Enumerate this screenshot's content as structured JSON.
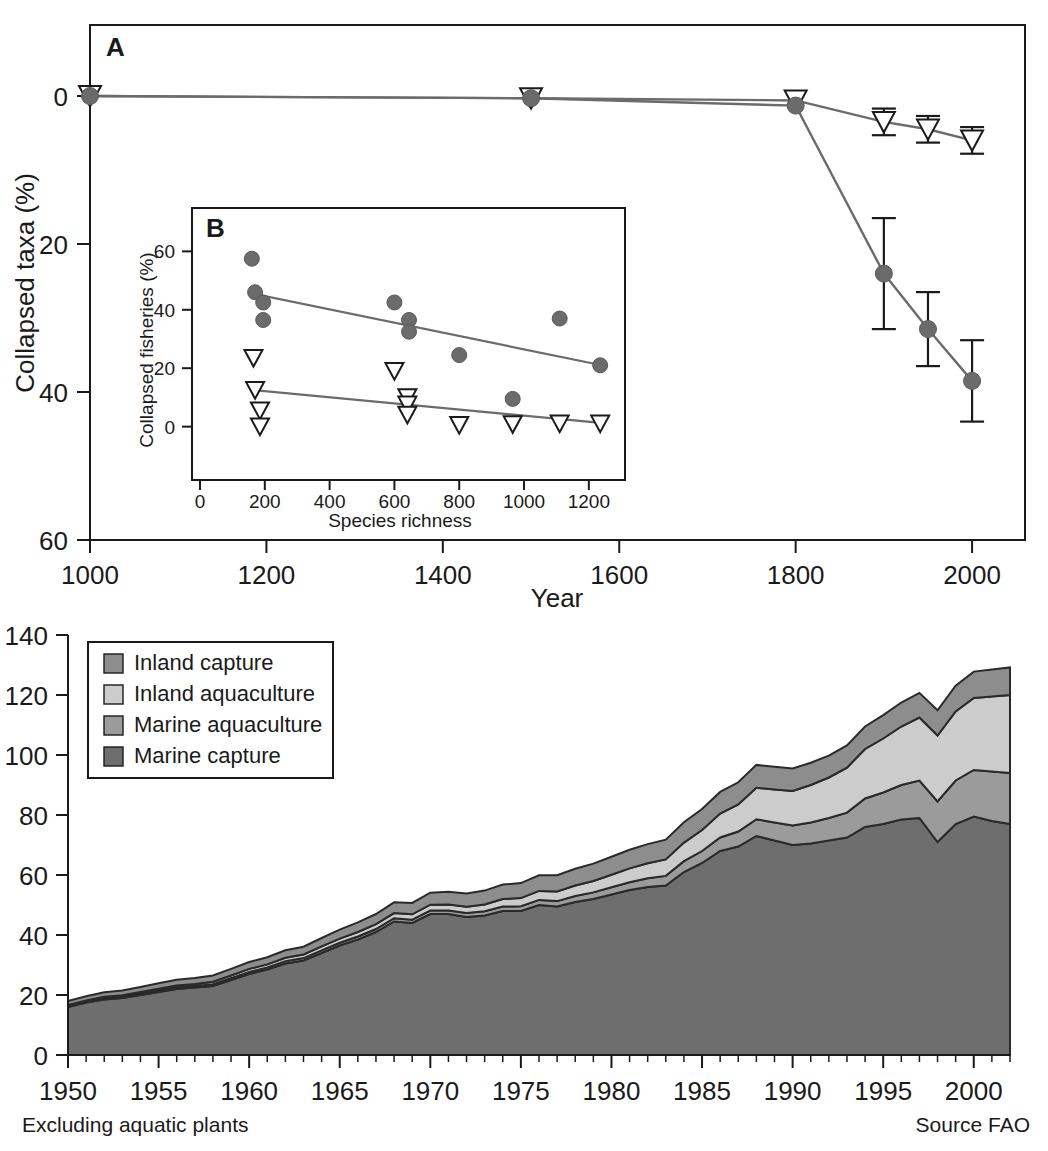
{
  "figure": {
    "panels": [
      "A",
      "B",
      "C"
    ]
  },
  "panel_a": {
    "letter": "A",
    "xlabel": "Year",
    "ylabel": "Collapsed taxa (%)",
    "xticks": [
      1000,
      1200,
      1400,
      1600,
      1800,
      2000
    ],
    "yticks": [
      0,
      20,
      40,
      60
    ],
    "xlim": [
      1000,
      2060
    ],
    "ylim": [
      0,
      60
    ],
    "y_inverted": true
  },
  "panel_b": {
    "letter": "B",
    "xlabel": "Species richness",
    "ylabel": "Collapsed fisheries (%)",
    "xticks": [
      0,
      200,
      400,
      600,
      800,
      1000,
      1200
    ],
    "yticks": [
      0,
      20,
      40,
      60
    ],
    "xlim": [
      0,
      1290
    ],
    "ylim": [
      -8,
      68
    ]
  },
  "panel_c": {
    "xticks": [
      1950,
      1955,
      1960,
      1965,
      1970,
      1975,
      1980,
      1985,
      1990,
      1995,
      2000
    ],
    "yticks": [
      0,
      20,
      40,
      60,
      80,
      100,
      120,
      140
    ],
    "xlim": [
      1950,
      2002
    ],
    "ylim": [
      0,
      140
    ],
    "footnote_left": "Excluding aquatic plants",
    "footnote_right": "Source FAO",
    "legend": [
      {
        "label": "Inland capture",
        "color": "#8d8d8d"
      },
      {
        "label": "Inland aquaculture",
        "color": "#cccccc"
      },
      {
        "label": "Marine aquaculture",
        "color": "#9b9b9b"
      },
      {
        "label": "Marine capture",
        "color": "#6e6e6e"
      }
    ]
  },
  "colors": {
    "marker_fill": "#6b6b6b",
    "line": "#6b6b6b",
    "axis": "#1a1a1a",
    "inland_capture": "#8d8d8d",
    "inland_aquaculture": "#cccccc",
    "marine_aquaculture": "#9b9b9b",
    "marine_capture": "#6e6e6e"
  },
  "chart_data": [
    {
      "id": "panel_a",
      "type": "line",
      "title": "A",
      "xlabel": "Year",
      "ylabel": "Collapsed taxa (%)",
      "xlim": [
        1000,
        2060
      ],
      "ylim": [
        0,
        60
      ],
      "y_inverted": true,
      "grid": false,
      "legend_position": "none",
      "series": [
        {
          "name": "Species-poor (triangles)",
          "marker": "triangle-down-open",
          "x": [
            1000,
            1500,
            1800,
            1900,
            1950,
            2000
          ],
          "values": [
            0.0,
            0.3,
            0.6,
            3.5,
            4.5,
            6.0
          ],
          "yerr": [
            0.0,
            0.0,
            0.0,
            1.8,
            1.8,
            1.8
          ]
        },
        {
          "name": "Species-rich (circles)",
          "marker": "circle-filled",
          "x": [
            1000,
            1500,
            1800,
            1900,
            1950,
            2000
          ],
          "values": [
            0.0,
            0.3,
            1.3,
            24.0,
            31.5,
            38.5
          ],
          "yerr": [
            0.0,
            0.0,
            0.0,
            7.5,
            5.0,
            5.5
          ]
        }
      ]
    },
    {
      "id": "panel_b",
      "type": "scatter",
      "title": "B",
      "xlabel": "Species richness",
      "ylabel": "Collapsed fisheries (%)",
      "xlim": [
        0,
        1290
      ],
      "ylim": [
        -8,
        68
      ],
      "grid": false,
      "legend_position": "none",
      "series": [
        {
          "name": "Collapsed fisheries (circles)",
          "marker": "circle-filled",
          "points": [
            [
              160,
              57.5
            ],
            [
              170,
              46.0
            ],
            [
              195,
              42.5
            ],
            [
              195,
              36.5
            ],
            [
              600,
              42.5
            ],
            [
              645,
              36.5
            ],
            [
              645,
              32.5
            ],
            [
              800,
              24.5
            ],
            [
              965,
              9.5
            ],
            [
              1110,
              37.0
            ],
            [
              1235,
              21.0
            ]
          ],
          "fit_line": {
            "x": [
              165,
              1240
            ],
            "y": [
              45.5,
              21.0
            ]
          }
        },
        {
          "name": "Open triangles",
          "marker": "triangle-down-open",
          "points": [
            [
              165,
              23.5
            ],
            [
              170,
              12.5
            ],
            [
              185,
              5.5
            ],
            [
              185,
              0.0
            ],
            [
              600,
              19.0
            ],
            [
              640,
              10.0
            ],
            [
              640,
              7.5
            ],
            [
              640,
              4.0
            ],
            [
              800,
              0.5
            ],
            [
              965,
              0.8
            ],
            [
              1110,
              1.0
            ],
            [
              1235,
              1.0
            ]
          ],
          "fit_line": {
            "x": [
              165,
              1245
            ],
            "y": [
              12.5,
              1.2
            ]
          }
        }
      ]
    },
    {
      "id": "panel_c",
      "type": "area",
      "title": "",
      "xlabel": "",
      "ylabel": "",
      "xlim": [
        1950,
        2002
      ],
      "ylim": [
        0,
        140
      ],
      "grid": false,
      "legend_position": "top-left",
      "note_left": "Excluding aquatic plants",
      "note_right": "Source FAO",
      "stack_order_bottom_to_top": [
        "Marine capture",
        "Marine aquaculture",
        "Inland aquaculture",
        "Inland capture"
      ],
      "x": [
        1950,
        1951,
        1952,
        1953,
        1954,
        1955,
        1956,
        1957,
        1958,
        1959,
        1960,
        1961,
        1962,
        1963,
        1964,
        1965,
        1966,
        1967,
        1968,
        1969,
        1970,
        1971,
        1972,
        1973,
        1974,
        1975,
        1976,
        1977,
        1978,
        1979,
        1980,
        1981,
        1982,
        1983,
        1984,
        1985,
        1986,
        1987,
        1988,
        1989,
        1990,
        1991,
        1992,
        1993,
        1994,
        1995,
        1996,
        1997,
        1998,
        1999,
        2000,
        2001,
        2002
      ],
      "series": [
        {
          "name": "Marine capture",
          "color": "#6e6e6e",
          "values": [
            16.0,
            17.5,
            18.5,
            19.0,
            20.0,
            21.0,
            22.0,
            22.5,
            23.0,
            25.0,
            27.0,
            28.5,
            30.5,
            31.5,
            34.0,
            36.5,
            38.5,
            41.0,
            44.5,
            44.0,
            47.0,
            47.0,
            46.0,
            46.5,
            48.0,
            48.0,
            50.0,
            49.5,
            51.0,
            52.0,
            53.5,
            55.0,
            56.0,
            56.5,
            61.0,
            64.0,
            68.0,
            69.5,
            73.0,
            71.5,
            70.0,
            70.5,
            71.5,
            72.5,
            76.0,
            77.0,
            78.5,
            79.0,
            71.0,
            77.0,
            79.5,
            78.0,
            77.0
          ]
        },
        {
          "name": "Marine aquaculture",
          "color": "#9b9b9b",
          "values": [
            0.3,
            0.3,
            0.4,
            0.4,
            0.4,
            0.5,
            0.5,
            0.5,
            0.6,
            0.6,
            0.7,
            0.7,
            0.8,
            0.8,
            0.9,
            0.9,
            1.0,
            1.0,
            1.1,
            1.1,
            1.2,
            1.2,
            1.3,
            1.4,
            1.5,
            1.6,
            1.7,
            1.8,
            2.0,
            2.2,
            2.4,
            2.6,
            2.9,
            3.2,
            3.6,
            4.0,
            4.5,
            5.0,
            5.6,
            6.0,
            6.5,
            7.0,
            7.5,
            8.3,
            9.5,
            10.5,
            11.5,
            12.5,
            13.5,
            14.5,
            15.5,
            16.5,
            17.0
          ]
        },
        {
          "name": "Inland aquaculture",
          "color": "#cccccc",
          "values": [
            0.4,
            0.4,
            0.5,
            0.5,
            0.6,
            0.6,
            0.7,
            0.7,
            0.8,
            0.9,
            1.0,
            1.0,
            1.1,
            1.2,
            1.3,
            1.4,
            1.5,
            1.6,
            1.7,
            1.8,
            1.9,
            2.0,
            2.1,
            2.3,
            2.5,
            2.7,
            3.0,
            3.2,
            3.5,
            3.8,
            4.2,
            4.6,
            5.0,
            5.5,
            6.2,
            7.0,
            8.0,
            9.0,
            10.5,
            11.0,
            11.5,
            12.5,
            13.5,
            15.0,
            16.5,
            18.0,
            19.5,
            21.0,
            22.0,
            23.0,
            24.0,
            25.0,
            26.0
          ]
        },
        {
          "name": "Inland capture",
          "color": "#8d8d8d",
          "values": [
            1.3,
            1.4,
            1.5,
            1.6,
            1.7,
            1.8,
            1.9,
            2.0,
            2.1,
            2.2,
            2.3,
            2.4,
            2.5,
            2.6,
            2.8,
            3.0,
            3.2,
            3.4,
            3.6,
            3.8,
            4.0,
            4.2,
            4.4,
            4.6,
            4.8,
            5.0,
            5.2,
            5.4,
            5.6,
            5.8,
            6.0,
            6.2,
            6.4,
            6.6,
            6.8,
            7.0,
            7.2,
            7.4,
            7.6,
            7.6,
            7.5,
            7.4,
            7.3,
            7.4,
            7.5,
            7.8,
            8.0,
            8.2,
            8.4,
            8.6,
            8.8,
            9.0,
            9.2
          ]
        }
      ]
    }
  ]
}
